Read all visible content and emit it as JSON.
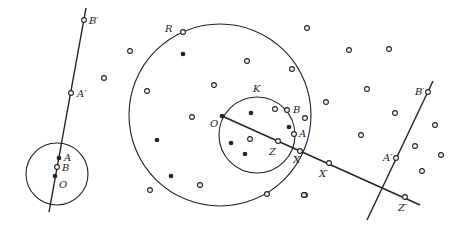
{
  "diagram": {
    "stroke_color": "#222222",
    "background": "#ffffff",
    "left_figure": {
      "circle": {
        "cx": 57,
        "cy": 174,
        "r": 31
      },
      "line": {
        "x1": 49,
        "y1": 212,
        "x2": 86,
        "y2": 8
      },
      "points": [
        {
          "id": "B'",
          "label": "B′",
          "x": 84,
          "y": 20,
          "lx": 89,
          "ly": 24,
          "filled": false
        },
        {
          "id": "A'",
          "label": "A′",
          "x": 71,
          "y": 93,
          "lx": 77,
          "ly": 97,
          "filled": false
        },
        {
          "id": "A",
          "label": "A",
          "x": 59,
          "y": 158,
          "lx": 64,
          "ly": 161,
          "filled": true
        },
        {
          "id": "B",
          "label": "B",
          "x": 57,
          "y": 167,
          "lx": 62,
          "ly": 171,
          "filled": false
        },
        {
          "id": "O",
          "label": "O",
          "x": 55,
          "y": 176,
          "lx": 59,
          "ly": 188,
          "filled": true
        }
      ]
    },
    "middle_figure": {
      "circle_R": {
        "label": "R",
        "cx": 220,
        "cy": 115,
        "r": 91,
        "lx": 165,
        "ly": 32
      },
      "circle_K": {
        "label": "K",
        "cx": 257,
        "cy": 135,
        "r": 38,
        "lx": 253,
        "ly": 92
      },
      "ray": {
        "x1": 222,
        "y1": 116,
        "x2": 420,
        "y2": 205
      },
      "points": [
        {
          "id": "O",
          "label": "O",
          "x": 222,
          "y": 116,
          "lx": 210,
          "ly": 127,
          "filled": true
        },
        {
          "id": "B",
          "label": "B",
          "x": 287,
          "y": 110,
          "lx": 293,
          "ly": 113,
          "filled": false
        },
        {
          "id": "A",
          "label": "A",
          "x": 294,
          "y": 134,
          "lx": 299,
          "ly": 137,
          "filled": false
        },
        {
          "id": "Z",
          "label": "Z",
          "x": 278,
          "y": 141,
          "lx": 269,
          "ly": 155,
          "filled": false
        },
        {
          "id": "X",
          "label": "X",
          "x": 300,
          "y": 151,
          "lx": 293,
          "ly": 163,
          "filled": false
        },
        {
          "id": "X'",
          "label": "X′",
          "x": 329,
          "y": 163,
          "lx": 319,
          "ly": 177,
          "filled": false
        },
        {
          "id": "Z'",
          "label": "Z′",
          "x": 405,
          "y": 197,
          "lx": 398,
          "ly": 211,
          "filled": false
        }
      ]
    },
    "right_figure": {
      "line": {
        "x1": 367,
        "y1": 220,
        "x2": 433,
        "y2": 81
      },
      "points": [
        {
          "id": "B'",
          "label": "B′",
          "x": 428,
          "y": 92,
          "lx": 415,
          "ly": 95,
          "filled": false
        },
        {
          "id": "A'",
          "label": "A′",
          "x": 396,
          "y": 158,
          "lx": 383,
          "ly": 161,
          "filled": false
        }
      ]
    },
    "scatter_points": [
      {
        "x": 104,
        "y": 78,
        "filled": false
      },
      {
        "x": 130,
        "y": 51,
        "filled": false
      },
      {
        "x": 183,
        "y": 32,
        "filled": false
      },
      {
        "x": 183,
        "y": 54,
        "filled": true
      },
      {
        "x": 147,
        "y": 91,
        "filled": false
      },
      {
        "x": 247,
        "y": 61,
        "filled": false
      },
      {
        "x": 214,
        "y": 85,
        "filled": false
      },
      {
        "x": 292,
        "y": 69,
        "filled": false
      },
      {
        "x": 307,
        "y": 28,
        "filled": false
      },
      {
        "x": 192,
        "y": 117,
        "filled": false
      },
      {
        "x": 157,
        "y": 140,
        "filled": true
      },
      {
        "x": 171,
        "y": 176,
        "filled": true
      },
      {
        "x": 150,
        "y": 190,
        "filled": false
      },
      {
        "x": 200,
        "y": 185,
        "filled": false
      },
      {
        "x": 267,
        "y": 194,
        "filled": false
      },
      {
        "x": 304,
        "y": 195,
        "filled": false
      },
      {
        "x": 305,
        "y": 118,
        "filled": false
      },
      {
        "x": 251,
        "y": 113,
        "filled": true
      },
      {
        "x": 275,
        "y": 109,
        "filled": false
      },
      {
        "x": 289,
        "y": 127,
        "filled": true
      },
      {
        "x": 231,
        "y": 143,
        "filled": true
      },
      {
        "x": 250,
        "y": 139,
        "filled": false
      },
      {
        "x": 245,
        "y": 154,
        "filled": true
      },
      {
        "x": 305,
        "y": 195,
        "filled": false
      },
      {
        "x": 349,
        "y": 50,
        "filled": false
      },
      {
        "x": 389,
        "y": 49,
        "filled": false
      },
      {
        "x": 367,
        "y": 89,
        "filled": false
      },
      {
        "x": 326,
        "y": 102,
        "filled": false
      },
      {
        "x": 395,
        "y": 113,
        "filled": false
      },
      {
        "x": 361,
        "y": 135,
        "filled": false
      },
      {
        "x": 435,
        "y": 125,
        "filled": false
      },
      {
        "x": 415,
        "y": 146,
        "filled": false
      },
      {
        "x": 441,
        "y": 155,
        "filled": false
      },
      {
        "x": 422,
        "y": 171,
        "filled": false
      },
      {
        "x": 304,
        "y": 195,
        "filled": false
      }
    ]
  }
}
